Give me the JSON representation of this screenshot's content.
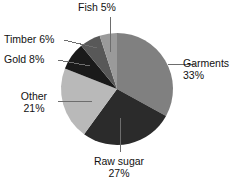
{
  "chart_data": {
    "type": "pie",
    "title": "",
    "categories": [
      "Garments",
      "Raw sugar",
      "Other",
      "Gold",
      "Timber",
      "Fish"
    ],
    "values": [
      33,
      27,
      21,
      8,
      6,
      5
    ],
    "units": "%",
    "start_angle_deg": 0,
    "direction": "clockwise",
    "legend": "none",
    "labels_position": "outside-with-leader-lines",
    "grid": false,
    "slices": [
      {
        "name": "Garments",
        "value": 33,
        "label_name": "Garments",
        "label_value": "33%",
        "color": "#808080",
        "start_deg": 0.0,
        "end_deg": 118.8
      },
      {
        "name": "Raw sugar",
        "value": 27,
        "label_name": "Raw sugar",
        "label_value": "27%",
        "color": "#2b2b2b",
        "start_deg": 118.8,
        "end_deg": 216.0
      },
      {
        "name": "Other",
        "value": 21,
        "label_name": "Other",
        "label_value": "21%",
        "color": "#b9b9b9",
        "start_deg": 216.0,
        "end_deg": 291.6
      },
      {
        "name": "Gold",
        "value": 8,
        "label_name": "Gold 8%",
        "label_value": "",
        "color": "#1a1a1a",
        "start_deg": 291.6,
        "end_deg": 320.4
      },
      {
        "name": "Timber",
        "value": 6,
        "label_name": "Timber 6%",
        "label_value": "",
        "color": "#585858",
        "start_deg": 320.4,
        "end_deg": 342.0
      },
      {
        "name": "Fish",
        "value": 5,
        "label_name": "Fish 5%",
        "label_value": "",
        "color": "#9a9a9a",
        "start_deg": 342.0,
        "end_deg": 360.0
      }
    ]
  },
  "labels": {
    "fish": {
      "line1": "Fish 5%",
      "line2": ""
    },
    "timber": {
      "line1": "Timber 6%",
      "line2": ""
    },
    "gold": {
      "line1": "Gold 8%",
      "line2": ""
    },
    "other": {
      "line1": "Other",
      "line2": "21%"
    },
    "garments": {
      "line1": "Garments",
      "line2": "33%"
    },
    "raw_sugar": {
      "line1": "Raw sugar",
      "line2": "27%"
    }
  },
  "style": {
    "background": "#ffffff",
    "leader_line_color": "#6d6d6d",
    "text_color": "#111111"
  }
}
